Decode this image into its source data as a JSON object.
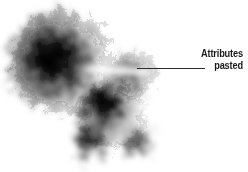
{
  "canvas": {
    "width": 248,
    "height": 172,
    "background_color": "#ffffff"
  },
  "annotation": {
    "label_line_1": "Attributes",
    "label_line_2": "pasted",
    "text_color": "#1a1a1a",
    "leader_line_color": "#2b2b2b",
    "leader_line": {
      "x1": 137,
      "y1": 68,
      "x2": 205,
      "y2": 68
    },
    "text_position": {
      "right": 5,
      "top": 47
    }
  },
  "artwork": {
    "description": "Grayscale fractal scribble cluster of three overlapping lobes",
    "ink_color": "#000000",
    "lobes": [
      {
        "name": "large-upper-left-lobe",
        "cx": 62,
        "cy": 62,
        "r": 60
      },
      {
        "name": "middle-right-lobe",
        "cx": 133,
        "cy": 74,
        "r": 30
      },
      {
        "name": "lower-center-lobe",
        "cx": 112,
        "cy": 120,
        "r": 42
      }
    ],
    "highlight_notches": [
      {
        "name": "upper-notch",
        "x": 78,
        "y": 66,
        "w": 70,
        "h": 7
      },
      {
        "name": "lower-notch",
        "x": 128,
        "y": 104,
        "w": 48,
        "h": 7
      }
    ]
  }
}
